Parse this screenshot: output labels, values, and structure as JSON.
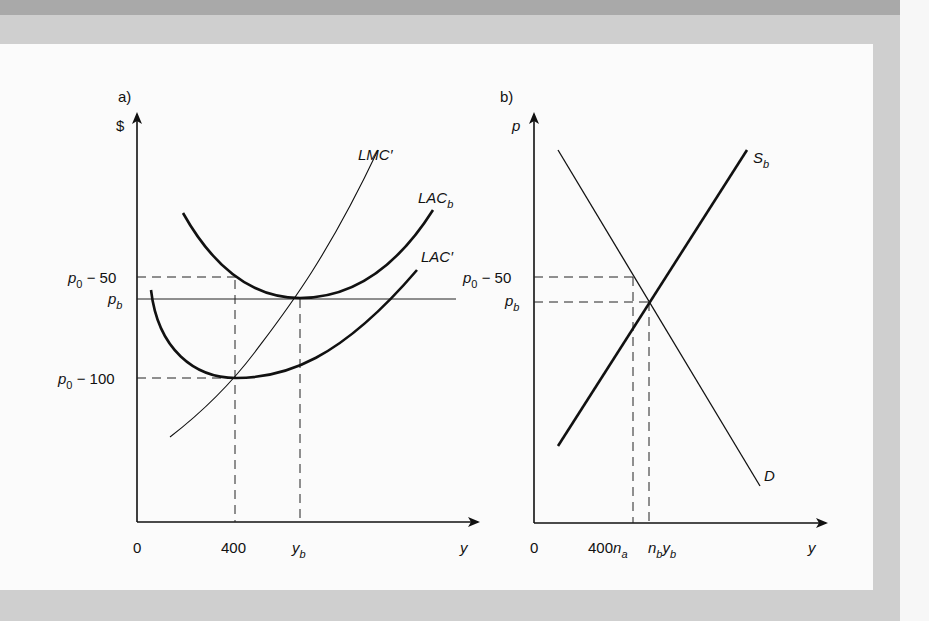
{
  "panels": {
    "a": {
      "label": "a)",
      "y_axis_label": "$",
      "x_axis_label": "y",
      "y_ticks": {
        "p0_minus_50": {
          "base": "p",
          "sub": "0",
          "rest": " − 50"
        },
        "p_b": {
          "base": "p",
          "sub": "b"
        },
        "p0_minus_100": {
          "base": "p",
          "sub": "0",
          "rest": " − 100"
        }
      },
      "x_ticks": {
        "zero": "0",
        "four_hundred": "400",
        "y_b": {
          "base": "y",
          "sub": "b"
        }
      },
      "curves": {
        "lmc": "LMC′",
        "lac_b": {
          "base": "LAC",
          "sub": "b"
        },
        "lac_prime": "LAC′"
      }
    },
    "b": {
      "label": "b)",
      "y_axis_label": "p",
      "x_axis_label": "y",
      "y_ticks": {
        "p0_minus_50": {
          "base": "p",
          "sub": "0",
          "rest": " − 50"
        },
        "p_b": {
          "base": "p",
          "sub": "b"
        }
      },
      "x_ticks": {
        "zero": "0",
        "n_a": {
          "prefix": "400",
          "base": "n",
          "sub": "a"
        },
        "n_b": {
          "base": "n",
          "sub": "b",
          "base2": "y",
          "sub2": "b"
        }
      },
      "curves": {
        "supply": {
          "base": "S",
          "sub": "b"
        },
        "demand": "D"
      }
    }
  },
  "colors": {
    "ink": "#111111",
    "panel_bg": "#fbfbfb",
    "frame": "#cfcfcf",
    "top_band": "#a9a9a9"
  }
}
